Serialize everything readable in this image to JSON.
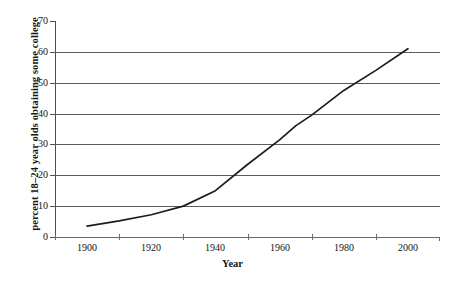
{
  "chart_data": {
    "type": "line",
    "title": "",
    "subtitle": "",
    "xlabel": "Year",
    "ylabel": "percent 18–24 year olds obtaining some college",
    "xlim": [
      1890,
      2010
    ],
    "ylim": [
      0,
      70
    ],
    "grid": true,
    "legend": "none",
    "x_tick_labels": [
      "1900",
      "1920",
      "1940",
      "1960",
      "1980",
      "2000"
    ],
    "x_tick_label_values": [
      1900,
      1920,
      1940,
      1960,
      1980,
      2000
    ],
    "x_tick_mark_values": [
      1890,
      1910,
      1930,
      1950,
      1970,
      1990
    ],
    "y_tick_labels": [
      "0",
      "10",
      "20",
      "30",
      "40",
      "50",
      "60",
      "70"
    ],
    "y_tick_values": [
      0,
      10,
      20,
      30,
      40,
      50,
      60,
      70
    ],
    "gridline_values": [
      10,
      20,
      30,
      40,
      50,
      60
    ],
    "series": [
      {
        "name": "percent 18-24 year olds obtaining some college",
        "color": "#1c1c1c",
        "x": [
          1900,
          1910,
          1920,
          1930,
          1940,
          1950,
          1960,
          1965,
          1970,
          1980,
          1990,
          2000
        ],
        "values": [
          3.5,
          5.2,
          7.2,
          10.0,
          15.0,
          23.5,
          31.5,
          36.0,
          39.5,
          47.5,
          54.0,
          61.0
        ]
      }
    ]
  },
  "axes": {
    "y_title": "percent 18–24 year olds obtaining some college",
    "x_title": "Year"
  },
  "colors": {
    "line": "#1c1c1c",
    "grid": "#5c5c5c",
    "axis": "#4f4f4f",
    "background": "#ffffff",
    "text": "#141414"
  }
}
